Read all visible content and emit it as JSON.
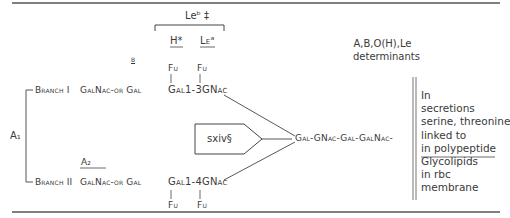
{
  "diagram": {
    "type": "blood-group-antigen-structure",
    "top_group_label": "Leᵇ ‡",
    "h_label": "H*",
    "lea_label": "Leᵃ",
    "b_footnote_label": "B",
    "determinants_label": [
      "A,B,O(H),Le",
      "determinants"
    ],
    "branch1": {
      "label": "Branch I",
      "terminal": "GalNac-or Gal",
      "core": "Gal1-3GNac",
      "fuc_left": "Fu",
      "fuc_right": "Fu"
    },
    "branch2": {
      "label": "Branch II",
      "a2_label": "A₂",
      "terminal": "GalNac-or Gal",
      "core": "Gal1-4GNac",
      "fuc_left": "Fu",
      "fuc_right": "Fu"
    },
    "a1_label": "A₁",
    "arrow_box_label": "sxiv§",
    "backbone": "Gal-GNac-Gal-GalNac-",
    "notes": [
      "In",
      "secretions",
      "serine, threonine",
      "linked to",
      "in polypeptide",
      "Glycolipids",
      "in rbc",
      "membrane"
    ]
  },
  "colors": {
    "text": "#3a3a3a",
    "rule": "#555555"
  }
}
